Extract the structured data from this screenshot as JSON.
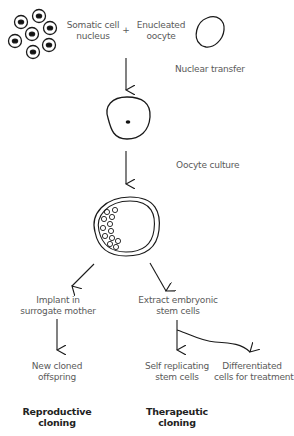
{
  "diagram": {
    "title": "",
    "inputs": {
      "somatic": {
        "line1": "Somatic cell",
        "line2": "nucleus"
      },
      "plus": "+",
      "oocyte": {
        "line1": "Enucleated",
        "line2": "oocyte"
      }
    },
    "steps": {
      "nuclear_transfer": "Nuclear transfer",
      "oocyte_culture": "Oocyte culture"
    },
    "branches": {
      "reproductive": {
        "step1": {
          "line1": "Implant in",
          "line2": "surrogate mother"
        },
        "result": {
          "line1": "New cloned",
          "line2": "offspring"
        },
        "category": {
          "line1": "Reproductive",
          "line2": "cloning"
        }
      },
      "therapeutic": {
        "step1": {
          "line1": "Extract embryonic",
          "line2": "stem cells"
        },
        "result_a": {
          "line1": "Self replicating",
          "line2": "stem cells"
        },
        "result_b": {
          "line1": "Differentiated",
          "line2": "cells for treatment"
        },
        "category": {
          "line1": "Therapeutic",
          "line2": "cloning"
        }
      }
    },
    "icons": {
      "somatic_cells": "cell-cluster-icon",
      "oocyte": "oocyte-oval-icon",
      "reconstructed_egg": "single-nucleus-egg-icon",
      "blastocyst": "blastocyst-icon"
    },
    "colors": {
      "line": "#1a1a1a",
      "text": "#5a5a5a",
      "bold_text": "#222222",
      "background": "#ffffff"
    }
  }
}
